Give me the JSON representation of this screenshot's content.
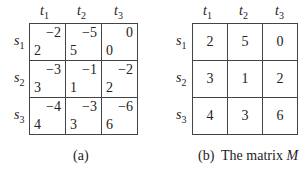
{
  "figure_a": {
    "col_labels": [
      {
        "var": "t",
        "sub": "1"
      },
      {
        "var": "t",
        "sub": "2"
      },
      {
        "var": "t",
        "sub": "3"
      }
    ],
    "row_labels": [
      {
        "var": "s",
        "sub": "1"
      },
      {
        "var": "s",
        "sub": "2"
      },
      {
        "var": "s",
        "sub": "3"
      }
    ],
    "cells": [
      [
        {
          "upper": "−2",
          "lower": "2"
        },
        {
          "upper": "−5",
          "lower": "5"
        },
        {
          "upper": "0",
          "lower": "0"
        }
      ],
      [
        {
          "upper": "−3",
          "lower": "3"
        },
        {
          "upper": "−1",
          "lower": "1"
        },
        {
          "upper": "−2",
          "lower": "2"
        }
      ],
      [
        {
          "upper": "−4",
          "lower": "4"
        },
        {
          "upper": "−3",
          "lower": "3"
        },
        {
          "upper": "−6",
          "lower": "6"
        }
      ]
    ],
    "caption": "(a)"
  },
  "figure_b": {
    "col_labels": [
      {
        "var": "t",
        "sub": "1"
      },
      {
        "var": "t",
        "sub": "2"
      },
      {
        "var": "t",
        "sub": "3"
      }
    ],
    "row_labels": [
      {
        "var": "s",
        "sub": "1"
      },
      {
        "var": "s",
        "sub": "2"
      },
      {
        "var": "s",
        "sub": "3"
      }
    ],
    "cells": [
      [
        "2",
        "5",
        "0"
      ],
      [
        "3",
        "1",
        "2"
      ],
      [
        "4",
        "3",
        "6"
      ]
    ],
    "caption_prefix": "(b)  The matrix ",
    "caption_symbol": "M"
  }
}
